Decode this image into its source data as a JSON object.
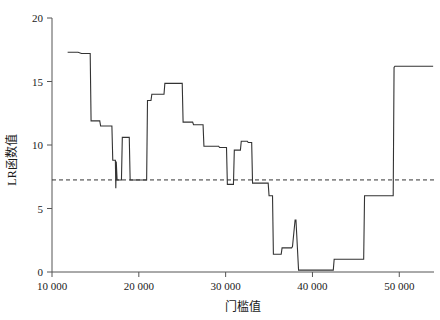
{
  "chart_data": {
    "type": "line",
    "title": "",
    "subtitle": "",
    "xlabel": "门槛值",
    "ylabel": "LR函数值",
    "xlim": [
      10000,
      54000
    ],
    "ylim": [
      0,
      20
    ],
    "xticks": [
      10000,
      20000,
      30000,
      40000,
      50000
    ],
    "xticklabels": [
      "10 000",
      "20 000",
      "30 000",
      "40 000",
      "50 000"
    ],
    "yticks": [
      0,
      5,
      10,
      15,
      20
    ],
    "yticklabels": [
      "0",
      "5",
      "10",
      "15",
      "20"
    ],
    "grid": false,
    "legend": null,
    "line_color": "#333333",
    "line_width": 1.1,
    "threshold_line": {
      "value": 7.25,
      "style": "dashed",
      "color": "#333333",
      "label": ""
    },
    "series": [
      {
        "name": "LR统计量",
        "step": "post",
        "x": [
          11800,
          13000,
          13400,
          14400,
          14500,
          15500,
          15600,
          16900,
          17000,
          17300,
          17350,
          17400,
          17500,
          18000,
          18100,
          18900,
          19000,
          20900,
          21000,
          21400,
          21500,
          22900,
          23000,
          25000,
          25100,
          26200,
          26300,
          27400,
          27500,
          29200,
          29300,
          30100,
          30200,
          30900,
          31000,
          31700,
          31800,
          32500,
          32600,
          33000,
          33100,
          34900,
          35000,
          35400,
          35500,
          36400,
          36500,
          37600,
          37700,
          38000,
          38100,
          38400,
          38500,
          42400,
          42500,
          45900,
          46000,
          49300,
          49400,
          49500,
          53900
        ],
        "y": [
          17.3,
          17.3,
          17.2,
          17.2,
          11.9,
          11.9,
          11.5,
          11.5,
          8.8,
          8.8,
          6.6,
          8.7,
          7.25,
          7.25,
          10.6,
          10.6,
          7.25,
          7.25,
          13.5,
          13.5,
          14.0,
          14.0,
          14.85,
          14.85,
          11.8,
          11.8,
          11.6,
          11.6,
          9.9,
          9.9,
          9.8,
          9.8,
          6.9,
          6.9,
          9.6,
          9.6,
          10.3,
          10.3,
          10.2,
          10.2,
          7.0,
          7.0,
          6.0,
          6.0,
          1.4,
          1.4,
          1.9,
          1.9,
          2.0,
          4.1,
          4.1,
          0.15,
          0.15,
          0.15,
          1.0,
          1.0,
          6.0,
          6.0,
          16.1,
          16.2,
          16.2
        ]
      }
    ]
  },
  "axes": {
    "x_axis_name": "门槛值轴",
    "y_axis_name": "LR函数值轴"
  }
}
